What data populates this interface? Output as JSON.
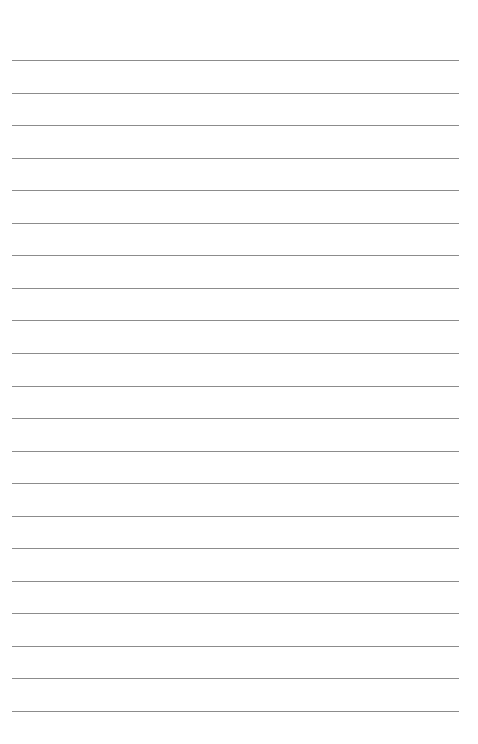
{
  "page": {
    "type": "lined-paper",
    "background_color": "#ffffff",
    "line_color": "#8c8c8c",
    "line_count": 21,
    "first_line_y": 60,
    "line_spacing": 32.55,
    "line_left": 12,
    "line_width": 447,
    "text": []
  }
}
